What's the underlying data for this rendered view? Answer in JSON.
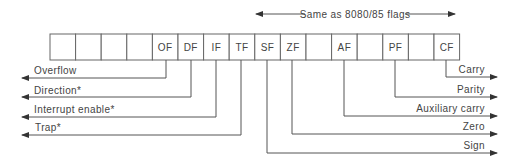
{
  "header": {
    "bracket_label": "Same as 8080/85 flags"
  },
  "register": {
    "cells": [
      "",
      "",
      "",
      "",
      "OF",
      "DF",
      "IF",
      "TF",
      "SF",
      "ZF",
      "",
      "AF",
      "",
      "PF",
      "",
      "CF"
    ]
  },
  "left_flags": [
    {
      "flag": "OF",
      "label": "Overflow"
    },
    {
      "flag": "DF",
      "label": "Direction*"
    },
    {
      "flag": "IF",
      "label": "Interrupt enable*"
    },
    {
      "flag": "TF",
      "label": "Trap*"
    }
  ],
  "right_flags": [
    {
      "flag": "CF",
      "label": "Carry"
    },
    {
      "flag": "PF",
      "label": "Parity"
    },
    {
      "flag": "AF",
      "label": "Auxiliary carry"
    },
    {
      "flag": "ZF",
      "label": "Zero"
    },
    {
      "flag": "SF",
      "label": "Sign"
    }
  ]
}
